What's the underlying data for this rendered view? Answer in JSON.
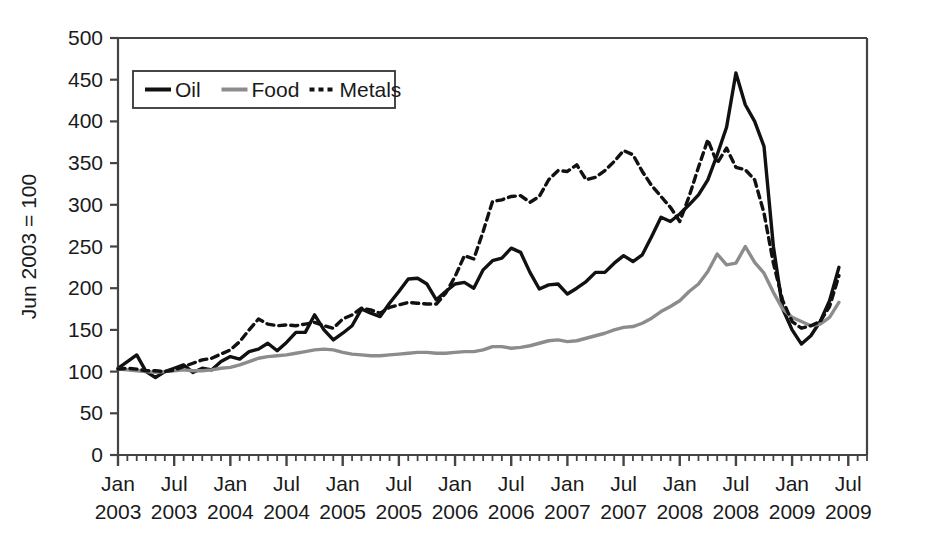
{
  "chart_data": {
    "type": "line",
    "title": "",
    "subtitle": "",
    "xlabel": "",
    "ylabel": "Jun 2003 = 100",
    "ylim": [
      0,
      500
    ],
    "ytick_step": 50,
    "yticks": [
      "0",
      "50",
      "100",
      "150",
      "200",
      "250",
      "300",
      "350",
      "400",
      "450",
      "500"
    ],
    "grid": false,
    "legend_position": "top-left-inside",
    "x_tick_interval_months": 1,
    "x_major_interval_months": 6,
    "xtick_labels": [
      {
        "month": "Jan",
        "year": "2003"
      },
      {
        "month": "Jul",
        "year": "2003"
      },
      {
        "month": "Jan",
        "year": "2004"
      },
      {
        "month": "Jul",
        "year": "2004"
      },
      {
        "month": "Jan",
        "year": "2005"
      },
      {
        "month": "Jul",
        "year": "2005"
      },
      {
        "month": "Jan",
        "year": "2006"
      },
      {
        "month": "Jul",
        "year": "2006"
      },
      {
        "month": "Jan",
        "year": "2007"
      },
      {
        "month": "Jul",
        "year": "2007"
      },
      {
        "month": "Jan",
        "year": "2008"
      },
      {
        "month": "Jul",
        "year": "2008"
      },
      {
        "month": "Jan",
        "year": "2009"
      },
      {
        "month": "Jul",
        "year": "2009"
      }
    ],
    "x": [
      "2003-01",
      "2003-02",
      "2003-03",
      "2003-04",
      "2003-05",
      "2003-06",
      "2003-07",
      "2003-08",
      "2003-09",
      "2003-10",
      "2003-11",
      "2003-12",
      "2004-01",
      "2004-02",
      "2004-03",
      "2004-04",
      "2004-05",
      "2004-06",
      "2004-07",
      "2004-08",
      "2004-09",
      "2004-10",
      "2004-11",
      "2004-12",
      "2005-01",
      "2005-02",
      "2005-03",
      "2005-04",
      "2005-05",
      "2005-06",
      "2005-07",
      "2005-08",
      "2005-09",
      "2005-10",
      "2005-11",
      "2005-12",
      "2006-01",
      "2006-02",
      "2006-03",
      "2006-04",
      "2006-05",
      "2006-06",
      "2006-07",
      "2006-08",
      "2006-09",
      "2006-10",
      "2006-11",
      "2006-12",
      "2007-01",
      "2007-02",
      "2007-03",
      "2007-04",
      "2007-05",
      "2007-06",
      "2007-07",
      "2007-08",
      "2007-09",
      "2007-10",
      "2007-11",
      "2007-12",
      "2008-01",
      "2008-02",
      "2008-03",
      "2008-04",
      "2008-05",
      "2008-06",
      "2008-07",
      "2008-08",
      "2008-09",
      "2008-10",
      "2008-11",
      "2008-12",
      "2009-01",
      "2009-02",
      "2009-03",
      "2009-04",
      "2009-05",
      "2009-06"
    ],
    "series": [
      {
        "name": "Oil",
        "style": "solid",
        "color": "#111111",
        "width": 3.4,
        "values": [
          104,
          112,
          120,
          100,
          93,
          100,
          104,
          108,
          99,
          104,
          102,
          112,
          118,
          115,
          124,
          127,
          134,
          125,
          135,
          147,
          147,
          168,
          150,
          138,
          146,
          155,
          175,
          170,
          166,
          182,
          196,
          211,
          212,
          205,
          186,
          196,
          205,
          207,
          200,
          222,
          233,
          236,
          248,
          243,
          219,
          199,
          204,
          205,
          193,
          200,
          208,
          219,
          219,
          230,
          239,
          232,
          240,
          262,
          285,
          280,
          289,
          300,
          312,
          330,
          360,
          393,
          458,
          420,
          400,
          370,
          250,
          175,
          150,
          133,
          143,
          160,
          185,
          225
        ]
      },
      {
        "name": "Food",
        "style": "solid",
        "color": "#8c8c8c",
        "width": 3.4,
        "values": [
          103,
          102,
          101,
          100,
          99,
          100,
          101,
          102,
          101,
          101,
          102,
          104,
          105,
          108,
          112,
          116,
          118,
          119,
          120,
          122,
          124,
          126,
          127,
          126,
          123,
          121,
          120,
          119,
          119,
          120,
          121,
          122,
          123,
          123,
          122,
          122,
          123,
          124,
          124,
          126,
          130,
          130,
          128,
          129,
          131,
          134,
          137,
          138,
          136,
          137,
          140,
          143,
          146,
          150,
          153,
          154,
          158,
          164,
          172,
          178,
          185,
          196,
          205,
          220,
          241,
          228,
          230,
          250,
          231,
          218,
          195,
          175,
          165,
          160,
          155,
          157,
          165,
          183
        ]
      },
      {
        "name": "Metals",
        "style": "dotted",
        "color": "#111111",
        "width": 3.4,
        "values": [
          103,
          104,
          103,
          101,
          101,
          100,
          102,
          106,
          110,
          114,
          116,
          121,
          126,
          136,
          150,
          163,
          157,
          155,
          156,
          155,
          157,
          159,
          155,
          152,
          163,
          168,
          176,
          174,
          170,
          177,
          180,
          183,
          182,
          181,
          181,
          194,
          214,
          239,
          235,
          268,
          304,
          306,
          310,
          311,
          303,
          310,
          330,
          341,
          340,
          348,
          330,
          333,
          341,
          352,
          365,
          360,
          340,
          323,
          310,
          297,
          280,
          310,
          345,
          378,
          350,
          368,
          345,
          342,
          330,
          290,
          230,
          185,
          160,
          152,
          155,
          160,
          178,
          215
        ]
      }
    ],
    "legend": [
      {
        "label": "Oil",
        "style": "solid",
        "color": "#111111"
      },
      {
        "label": "Food",
        "style": "solid",
        "color": "#8c8c8c"
      },
      {
        "label": "Metals",
        "style": "dotted",
        "color": "#111111"
      }
    ]
  }
}
